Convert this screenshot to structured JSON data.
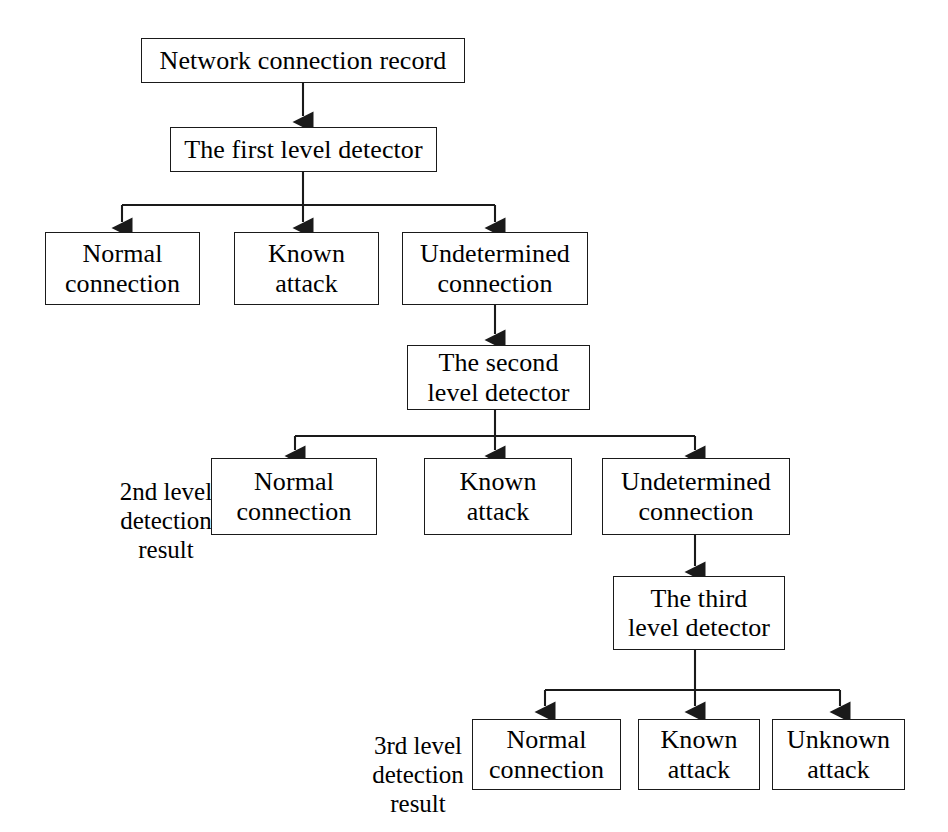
{
  "diagram": {
    "type": "flowchart",
    "orientation": "top-down",
    "style": {
      "box_stroke": "#1a1a1a",
      "box_fill": "#ffffff",
      "line_color": "#1a1a1a",
      "text_color": "#000000",
      "background": "#ffffff"
    },
    "nodes": {
      "input": {
        "label": "Network connection record"
      },
      "detector1": {
        "label": "The first level detector"
      },
      "l1_normal": {
        "label": "Normal\nconnection"
      },
      "l1_known": {
        "label": "Known\nattack"
      },
      "l1_undetermined": {
        "label": "Undetermined\nconnection"
      },
      "detector2": {
        "label": "The second\nlevel detector"
      },
      "l2_normal": {
        "label": "Normal\nconnection"
      },
      "l2_known": {
        "label": "Known\nattack"
      },
      "l2_undetermined": {
        "label": "Undetermined\nconnection"
      },
      "detector3": {
        "label": "The third\nlevel detector"
      },
      "l3_normal": {
        "label": "Normal\nconnection"
      },
      "l3_known": {
        "label": "Known\nattack"
      },
      "l3_unknown": {
        "label": "Unknown\nattack"
      }
    },
    "side_labels": {
      "level2_result": "2nd level\ndetection\nresult",
      "level3_result": "3rd level\ndetection\nresult"
    },
    "edges": [
      {
        "from": "input",
        "to": "detector1",
        "arrow": "filled-triangle"
      },
      {
        "from": "detector1",
        "to": "l1_normal",
        "arrow": "filled-triangle"
      },
      {
        "from": "detector1",
        "to": "l1_known",
        "arrow": "filled-triangle"
      },
      {
        "from": "detector1",
        "to": "l1_undetermined",
        "arrow": "filled-triangle"
      },
      {
        "from": "l1_undetermined",
        "to": "detector2",
        "arrow": "filled-triangle"
      },
      {
        "from": "detector2",
        "to": "l2_normal",
        "arrow": "filled-triangle"
      },
      {
        "from": "detector2",
        "to": "l2_known",
        "arrow": "filled-triangle"
      },
      {
        "from": "detector2",
        "to": "l2_undetermined",
        "arrow": "filled-triangle"
      },
      {
        "from": "l2_undetermined",
        "to": "detector3",
        "arrow": "filled-triangle"
      },
      {
        "from": "detector3",
        "to": "l3_normal",
        "arrow": "filled-triangle"
      },
      {
        "from": "detector3",
        "to": "l3_known",
        "arrow": "filled-triangle"
      },
      {
        "from": "detector3",
        "to": "l3_unknown",
        "arrow": "filled-triangle"
      }
    ]
  }
}
